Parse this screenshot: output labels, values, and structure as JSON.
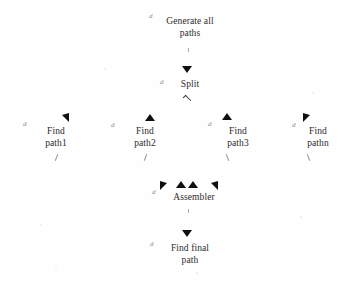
{
  "diagram": {
    "background_color": "#fefefe",
    "text_color": "#2b2b2b",
    "arrow_color": "#101010",
    "ghost_mark_color": "#8c8c8c",
    "ghost_mark_glyph": "d",
    "nodes": [
      {
        "id": "generate-all-paths",
        "label": "Generate all\npaths"
      },
      {
        "id": "split",
        "label": "Split"
      },
      {
        "id": "find-path1",
        "label": "Find\npath1"
      },
      {
        "id": "find-path2",
        "label": "Find\npath2"
      },
      {
        "id": "find-path3",
        "label": "Find\npath3"
      },
      {
        "id": "find-pathn",
        "label": "Find\npathn"
      },
      {
        "id": "assembler",
        "label": "Assembler"
      },
      {
        "id": "find-final-path",
        "label": "Find final\npath"
      }
    ],
    "edges": [
      {
        "from": "generate-all-paths",
        "to": "split",
        "arrowhead": "down"
      },
      {
        "from": "split",
        "to": "find-path1",
        "arrowhead": "up-left"
      },
      {
        "from": "split",
        "to": "find-path2",
        "arrowhead": "up"
      },
      {
        "from": "split",
        "to": "find-path3",
        "arrowhead": "up"
      },
      {
        "from": "split",
        "to": "find-pathn",
        "arrowhead": "up-right"
      },
      {
        "from": "find-path1",
        "to": "assembler",
        "arrowhead": "up-right"
      },
      {
        "from": "find-path2",
        "to": "assembler",
        "arrowhead": "up"
      },
      {
        "from": "find-path3",
        "to": "assembler",
        "arrowhead": "up"
      },
      {
        "from": "find-pathn",
        "to": "assembler",
        "arrowhead": "up-left"
      },
      {
        "from": "assembler",
        "to": "find-final-path",
        "arrowhead": "down"
      }
    ]
  }
}
